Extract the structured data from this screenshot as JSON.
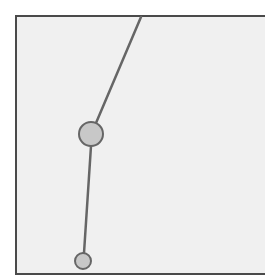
{
  "canvas": {
    "width": 265,
    "height": 279,
    "background": "#ffffff"
  },
  "frame": {
    "x": 16,
    "y": 16,
    "width": 260,
    "height": 258,
    "fill": "#f0f0f0",
    "stroke": "#4a4a4a",
    "stroke_width": 2
  },
  "segments": [
    {
      "id": "upper-segment",
      "x1": 141,
      "y1": 17,
      "x2": 96,
      "y2": 123,
      "stroke": "#666666",
      "stroke_width": 2.5
    },
    {
      "id": "lower-segment",
      "x1": 91,
      "y1": 146,
      "x2": 84,
      "y2": 253,
      "stroke": "#666666",
      "stroke_width": 2.5
    }
  ],
  "nodes": [
    {
      "id": "large-node",
      "cx": 91,
      "cy": 134,
      "r": 12,
      "fill": "#c8c8c8",
      "stroke": "#666666",
      "stroke_width": 2
    },
    {
      "id": "small-node",
      "cx": 83,
      "cy": 261,
      "r": 8,
      "fill": "#c8c8c8",
      "stroke": "#666666",
      "stroke_width": 2
    }
  ]
}
